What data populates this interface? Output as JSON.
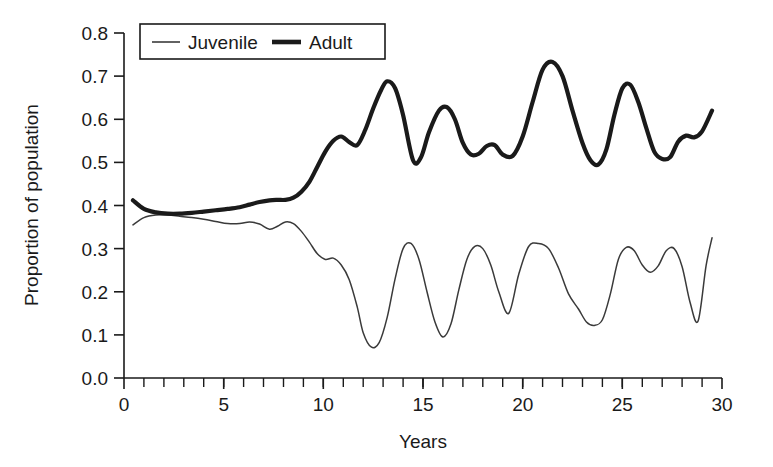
{
  "chart_data": {
    "type": "line",
    "title": "",
    "xlabel": "Years",
    "ylabel": "Proportion of population",
    "xlim": [
      0,
      30
    ],
    "ylim": [
      0.0,
      0.8
    ],
    "grid": false,
    "legend_position": "top-left-inside",
    "x_ticks": [
      "0",
      "5",
      "10",
      "15",
      "20",
      "25",
      "30"
    ],
    "x_tick_values": [
      0,
      5,
      10,
      15,
      20,
      25,
      30
    ],
    "x_minor_step": 1,
    "y_ticks": [
      "0.0",
      "0.1",
      "0.2",
      "0.3",
      "0.4",
      "0.5",
      "0.6",
      "0.7",
      "0.8"
    ],
    "y_tick_values": [
      0.0,
      0.1,
      0.2,
      0.3,
      0.4,
      0.5,
      0.6,
      0.7,
      0.8
    ],
    "series": [
      {
        "name": "Juvenile",
        "style": "thin",
        "color": "#3a3a3a",
        "x": [
          0.45,
          1.0,
          1.6,
          2.2,
          2.8,
          3.4,
          4.0,
          4.6,
          5.2,
          5.8,
          6.3,
          6.8,
          7.3,
          7.7,
          8.1,
          8.5,
          8.9,
          9.3,
          9.7,
          10.1,
          10.5,
          10.9,
          11.3,
          11.7,
          12.0,
          12.4,
          12.8,
          13.2,
          13.6,
          14.0,
          14.4,
          14.8,
          15.2,
          15.6,
          16.0,
          16.4,
          16.8,
          17.2,
          17.6,
          18.0,
          18.4,
          18.8,
          19.3,
          19.8,
          20.3,
          20.8,
          21.3,
          21.8,
          22.3,
          22.8,
          23.2,
          23.6,
          24.0,
          24.4,
          24.8,
          25.2,
          25.6,
          26.0,
          26.4,
          26.8,
          27.2,
          27.6,
          28.0,
          28.4,
          28.8,
          29.2,
          29.5
        ],
        "y": [
          0.355,
          0.372,
          0.378,
          0.378,
          0.375,
          0.372,
          0.368,
          0.363,
          0.358,
          0.358,
          0.362,
          0.357,
          0.345,
          0.352,
          0.362,
          0.358,
          0.34,
          0.315,
          0.288,
          0.275,
          0.278,
          0.262,
          0.228,
          0.165,
          0.105,
          0.072,
          0.082,
          0.14,
          0.23,
          0.3,
          0.312,
          0.275,
          0.2,
          0.13,
          0.095,
          0.125,
          0.205,
          0.275,
          0.305,
          0.3,
          0.262,
          0.2,
          0.15,
          0.24,
          0.305,
          0.312,
          0.3,
          0.255,
          0.195,
          0.16,
          0.13,
          0.122,
          0.135,
          0.195,
          0.275,
          0.303,
          0.295,
          0.262,
          0.245,
          0.26,
          0.295,
          0.3,
          0.258,
          0.175,
          0.132,
          0.26,
          0.325
        ],
        "notable_points": {
          "start": 0.355,
          "end": 0.077,
          "max": 0.378,
          "min": 0.055
        }
      },
      {
        "name": "Adult",
        "style": "thick",
        "color": "#1a1a1a",
        "x": [
          0.45,
          1.0,
          1.6,
          2.2,
          2.8,
          3.4,
          4.0,
          4.6,
          5.2,
          5.8,
          6.3,
          6.8,
          7.3,
          7.7,
          8.1,
          8.5,
          8.9,
          9.3,
          9.7,
          10.1,
          10.5,
          10.9,
          11.3,
          11.7,
          12.1,
          12.5,
          12.9,
          13.2,
          13.6,
          14.0,
          14.5,
          14.9,
          15.3,
          15.8,
          16.2,
          16.6,
          17.0,
          17.4,
          17.8,
          18.2,
          18.6,
          19.0,
          19.5,
          20.0,
          20.5,
          21.0,
          21.5,
          22.0,
          22.5,
          23.0,
          23.4,
          23.8,
          24.2,
          24.6,
          25.0,
          25.4,
          25.8,
          26.2,
          26.6,
          27.0,
          27.4,
          27.8,
          28.2,
          28.6,
          29.0,
          29.5
        ],
        "y": [
          0.412,
          0.392,
          0.384,
          0.381,
          0.381,
          0.383,
          0.386,
          0.389,
          0.392,
          0.396,
          0.402,
          0.408,
          0.412,
          0.413,
          0.413,
          0.418,
          0.432,
          0.455,
          0.49,
          0.525,
          0.55,
          0.56,
          0.547,
          0.54,
          0.575,
          0.625,
          0.668,
          0.688,
          0.672,
          0.61,
          0.505,
          0.512,
          0.57,
          0.62,
          0.628,
          0.6,
          0.545,
          0.518,
          0.52,
          0.538,
          0.54,
          0.518,
          0.515,
          0.56,
          0.64,
          0.715,
          0.733,
          0.7,
          0.62,
          0.545,
          0.505,
          0.495,
          0.53,
          0.61,
          0.672,
          0.68,
          0.64,
          0.58,
          0.525,
          0.508,
          0.512,
          0.548,
          0.562,
          0.558,
          0.572,
          0.62
        ],
        "notable_points": {
          "start": 0.412,
          "end": 0.62,
          "max": 0.733,
          "min": 0.381
        }
      }
    ]
  },
  "legend": {
    "items": [
      {
        "label": "Juvenile",
        "swatch": "thin-line"
      },
      {
        "label": "Adult",
        "swatch": "thick-line"
      }
    ]
  },
  "colors": {
    "axis": "#1a1a1a",
    "juvenile": "#3a3a3a",
    "adult": "#1a1a1a",
    "background": "#ffffff"
  }
}
